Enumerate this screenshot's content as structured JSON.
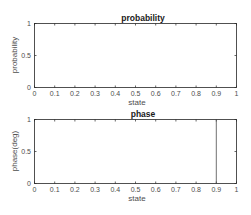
{
  "chart_data": [
    {
      "type": "bar",
      "title": "probability",
      "xlabel": "state",
      "ylabel": "probability",
      "xlim": [
        0,
        1
      ],
      "ylim": [
        0,
        1
      ],
      "xticks": [
        "0",
        "0.1",
        "0.2",
        "0.3",
        "0.4",
        "0.5",
        "0.6",
        "0.7",
        "0.8",
        "0.9",
        "1"
      ],
      "yticks": [
        "0",
        "0.5",
        "1"
      ],
      "grid": false,
      "x": [],
      "values": []
    },
    {
      "type": "bar",
      "title": "phase",
      "xlabel": "state",
      "ylabel": "phase(deg)",
      "xlim": [
        0,
        1
      ],
      "ylim": [
        0,
        1
      ],
      "xticks": [
        "0",
        "0.1",
        "0.2",
        "0.3",
        "0.4",
        "0.5",
        "0.6",
        "0.7",
        "0.8",
        "0.9",
        "1"
      ],
      "yticks": [
        "0",
        "0.5",
        "1"
      ],
      "grid": false,
      "x": [
        0.9
      ],
      "values": [
        1
      ]
    }
  ],
  "colors": {
    "axis": "#262626",
    "tick_text": "#4d4d4d",
    "line": "#4d4d4d",
    "background": "#ffffff"
  }
}
